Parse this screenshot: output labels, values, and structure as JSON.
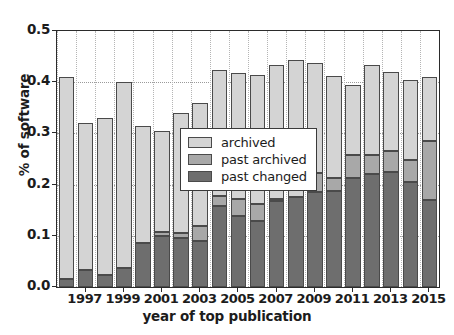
{
  "chart_data": {
    "type": "bar",
    "stacked": true,
    "title": "",
    "xlabel": "year of top publication",
    "ylabel": "% of software",
    "xlim": [
      1995.5,
      2015.5
    ],
    "ylim": [
      0.0,
      0.5
    ],
    "grid": true,
    "legend_position": "upper center (inside axes)",
    "ytick_labels": [
      "0.0",
      "0.1",
      "0.2",
      "0.3",
      "0.4",
      "0.5"
    ],
    "ytick_values": [
      0.0,
      0.1,
      0.2,
      0.3,
      0.4,
      0.5
    ],
    "xtick_labels": [
      "1997",
      "1999",
      "2001",
      "2003",
      "2005",
      "2007",
      "2009",
      "2011",
      "2013",
      "2015"
    ],
    "xtick_values": [
      1997,
      1999,
      2001,
      2003,
      2005,
      2007,
      2009,
      2011,
      2013,
      2015
    ],
    "categories": [
      1996,
      1997,
      1998,
      1999,
      2000,
      2001,
      2002,
      2003,
      2004,
      2005,
      2006,
      2007,
      2008,
      2009,
      2010,
      2011,
      2012,
      2013,
      2014,
      2015
    ],
    "series": [
      {
        "name": "past changed",
        "color": "#6e6e6e",
        "values": [
          0.016,
          0.034,
          0.024,
          0.037,
          0.086,
          0.099,
          0.095,
          0.09,
          0.159,
          0.138,
          0.128,
          0.168,
          0.176,
          0.185,
          0.187,
          0.213,
          0.221,
          0.225,
          0.205,
          0.17
        ]
      },
      {
        "name": "past archived",
        "color": "#a8a8a8",
        "values": [
          0.0,
          0.0,
          0.0,
          0.0,
          0.0,
          0.009,
          0.011,
          0.029,
          0.018,
          0.034,
          0.034,
          0.004,
          0.0,
          0.037,
          0.026,
          0.045,
          0.037,
          0.041,
          0.043,
          0.115
        ]
      },
      {
        "name": "archived",
        "color": "#d4d4d4",
        "values": [
          0.394,
          0.286,
          0.306,
          0.364,
          0.228,
          0.197,
          0.234,
          0.24,
          0.247,
          0.245,
          0.252,
          0.262,
          0.268,
          0.216,
          0.2,
          0.136,
          0.175,
          0.154,
          0.157,
          0.125
        ]
      }
    ],
    "bar_totals": [
      0.41,
      0.32,
      0.33,
      0.401,
      0.314,
      0.305,
      0.34,
      0.359,
      0.424,
      0.417,
      0.414,
      0.434,
      0.444,
      0.438,
      0.413,
      0.394,
      0.433,
      0.42,
      0.405,
      0.41
    ]
  },
  "legend": {
    "items": [
      {
        "label": "archived",
        "series": "archived"
      },
      {
        "label": "past archived",
        "series": "past archived"
      },
      {
        "label": "past changed",
        "series": "past changed"
      }
    ]
  }
}
